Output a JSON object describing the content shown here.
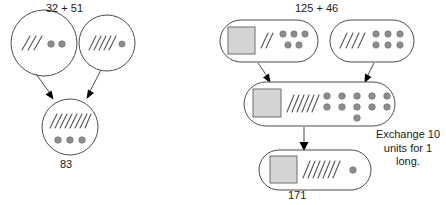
{
  "image": {
    "kind": "math-diagram",
    "topic": "base-ten block addition with regrouping",
    "width": 446,
    "height": 205,
    "background": "#ffffff",
    "stroke": "#4d4d4d",
    "text_color": "#1a1a1a",
    "block_fill": "#d4d4d4",
    "dot_fill": "#8c8c8c",
    "arrow_fill": "#000000"
  },
  "left_example": {
    "heading": "32 + 51",
    "result_label": "83",
    "addend_one": {
      "value": "32",
      "longs": 3,
      "units": 2,
      "unit_rows": [
        2
      ]
    },
    "addend_two": {
      "value": "51",
      "longs": 5,
      "units": 1,
      "unit_rows": [
        1
      ]
    },
    "sum": {
      "value": "83",
      "longs": 8,
      "units": 3,
      "unit_rows": [
        3
      ]
    }
  },
  "right_example": {
    "heading": "125 + 46",
    "result_label": "171",
    "note": "Exchange 10 units for 1 long.",
    "addend_one": {
      "value": "125",
      "flats": 1,
      "longs": 2,
      "units": 5,
      "unit_rows": [
        3,
        2
      ]
    },
    "addend_two": {
      "value": "46",
      "flats": 0,
      "longs": 4,
      "units": 6,
      "unit_rows": [
        3,
        3
      ]
    },
    "combined": {
      "value": "171",
      "flats": 1,
      "longs": 6,
      "units": 11,
      "unit_rows": [
        5,
        5,
        1
      ]
    },
    "regrouped": {
      "value": "171",
      "flats": 1,
      "longs": 7,
      "units": 1,
      "unit_rows": [
        1
      ]
    }
  }
}
